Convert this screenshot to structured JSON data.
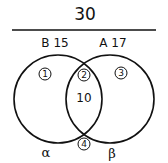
{
  "diagram": {
    "type": "venn",
    "total": "30",
    "sets": [
      {
        "name": "B",
        "count": "15",
        "label": "B 15",
        "greek": "α"
      },
      {
        "name": "A",
        "count": "17",
        "label": "A 17",
        "greek": "β"
      }
    ],
    "regions": [
      {
        "id": "1",
        "label": "1",
        "location": "B only"
      },
      {
        "id": "2",
        "label": "2",
        "location": "B and A",
        "count": "10"
      },
      {
        "id": "3",
        "label": "3",
        "location": "A only"
      },
      {
        "id": "4",
        "label": "4",
        "location": "outside both"
      }
    ],
    "intersection_count": "10",
    "colors": {
      "ink": "#111111",
      "background": "#ffffff"
    }
  }
}
